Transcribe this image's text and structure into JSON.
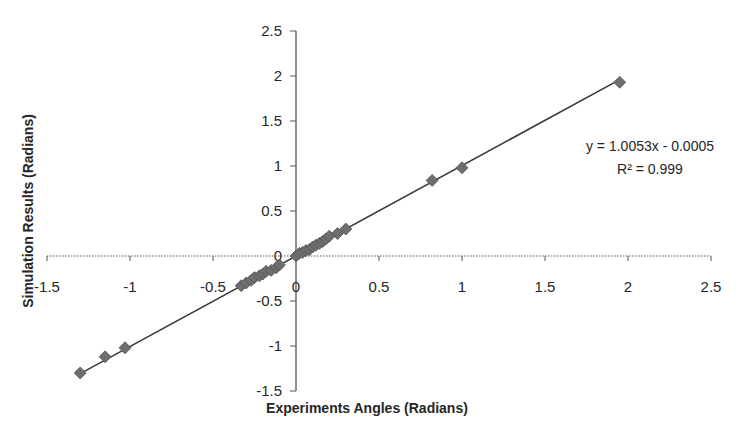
{
  "chart_data": {
    "type": "scatter",
    "title": "",
    "xlabel": "Experiments Angles (Radians)",
    "ylabel": "Simulation Results (Radians)",
    "xlim": [
      -1.5,
      2.5
    ],
    "ylim": [
      -1.5,
      2.5
    ],
    "x_ticks": [
      -1.5,
      -1,
      -0.5,
      0,
      0.5,
      1,
      1.5,
      2,
      2.5
    ],
    "y_ticks": [
      -1.5,
      -1,
      -0.5,
      0,
      0.5,
      1,
      1.5,
      2,
      2.5
    ],
    "x_tick_labels": [
      "-1.5",
      "-1",
      "-0.5",
      "0",
      "0.5",
      "1",
      "1.5",
      "2",
      "2.5"
    ],
    "y_tick_labels": [
      "-1.5",
      "-1",
      "-0.5",
      "0",
      "0.5",
      "1",
      "1.5",
      "2",
      "2.5"
    ],
    "grid": false,
    "legend": null,
    "marker": "diamond",
    "marker_color": "#6e6e6e",
    "line_color": "#3a3a3a",
    "series": [
      {
        "name": "Simulation vs Experiment",
        "x": [
          -1.3,
          -1.15,
          -1.03,
          -0.33,
          -0.3,
          -0.27,
          -0.25,
          -0.22,
          -0.2,
          -0.18,
          -0.15,
          -0.12,
          -0.1,
          0.0,
          0.02,
          0.04,
          0.06,
          0.08,
          0.1,
          0.12,
          0.14,
          0.16,
          0.18,
          0.2,
          0.25,
          0.3,
          0.82,
          1.0,
          1.95
        ],
        "y": [
          -1.3,
          -1.12,
          -1.02,
          -0.33,
          -0.3,
          -0.27,
          -0.24,
          -0.22,
          -0.2,
          -0.17,
          -0.16,
          -0.13,
          -0.1,
          0.0,
          0.03,
          0.04,
          0.06,
          0.07,
          0.1,
          0.12,
          0.14,
          0.16,
          0.19,
          0.22,
          0.25,
          0.3,
          0.84,
          0.98,
          1.93
        ]
      }
    ],
    "trendline": {
      "type": "linear",
      "slope": 1.0053,
      "intercept": -0.0005,
      "r_squared": 0.999,
      "x_range": [
        -1.3,
        1.95
      ]
    },
    "annotations": {
      "equation": "y = 1.0053x - 0.0005",
      "r_squared": "R² = 0.999"
    }
  }
}
